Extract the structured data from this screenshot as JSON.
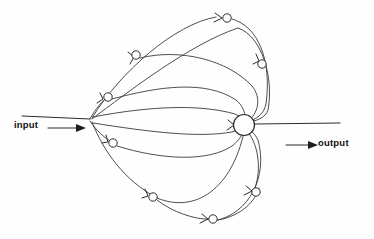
{
  "figure": {
    "type": "signal-flow-diagram",
    "title": "",
    "background_color": "#fefefe",
    "stroke_color": "#2b2b2b",
    "width": 374,
    "height": 239
  },
  "labels": {
    "input": "input",
    "output": "output"
  },
  "hub": {
    "name": "central-hub",
    "cx": 244,
    "cy": 125,
    "r": 10.5
  },
  "fanout_junction": {
    "name": "input-fanout-junction",
    "x": 90,
    "y": 120
  },
  "input_line": {
    "from_x": 22,
    "to_x": 90,
    "y": 116,
    "arrow_tip_x": 83,
    "arrow_y": 128
  },
  "output_line": {
    "from_x": 255,
    "to_x": 340,
    "y": 124,
    "arrow_tip_x": 315,
    "arrow_y": 145
  },
  "nodes": [
    {
      "name": "node-top",
      "cx": 227,
      "cy": 18,
      "r": 4.2
    },
    {
      "name": "node-upper-left",
      "cx": 136,
      "cy": 55,
      "r": 4.2
    },
    {
      "name": "node-left-upper",
      "cx": 108,
      "cy": 97,
      "r": 4.2
    },
    {
      "name": "node-left-lower",
      "cx": 113,
      "cy": 143,
      "r": 4.2
    },
    {
      "name": "node-lower-left",
      "cx": 153,
      "cy": 197,
      "r": 4.2
    },
    {
      "name": "node-bottom",
      "cx": 213,
      "cy": 219,
      "r": 4.2
    },
    {
      "name": "node-lower-right",
      "cx": 256,
      "cy": 192,
      "r": 4.2
    },
    {
      "name": "node-upper-right",
      "cx": 262,
      "cy": 64,
      "r": 4.2
    }
  ],
  "arcs": [
    {
      "name": "arc-outer-top",
      "d": "M 92 118 C 120 72 175 24 216 17"
    },
    {
      "name": "arc-top-return",
      "d": "M 232 19 C 258 26 272 60 266 104 C 264 114 256 120 248 121"
    },
    {
      "name": "arc-upper-1",
      "d": "M 92 119 C 128 92 190 44 238 28 C 262 36 274 78 268 110 C 266 118 254 122 247 122"
    },
    {
      "name": "arc-upper-2",
      "d": "M 140 58 C 180 48 228 60 252 86 C 262 98 258 114 248 121"
    },
    {
      "name": "arc-upper-3",
      "d": "M 112 99 C 160 86 206 80 236 100 C 244 106 246 116 245 121"
    },
    {
      "name": "arc-upper-inner",
      "d": "M 93 117 C 150 106 200 104 235 114 C 240 116 243 119 244 121"
    },
    {
      "name": "arc-lower-inner",
      "d": "M 93 123 C 150 132 198 138 232 132 C 238 130 242 127 244 127"
    },
    {
      "name": "arc-lower-1",
      "d": "M 117 146 C 162 160 208 162 232 146 C 240 140 244 132 244 128"
    },
    {
      "name": "arc-lower-2",
      "d": "M 92 122 C 104 152 124 180 157 198 C 196 214 232 188 244 132"
    },
    {
      "name": "arc-lower-3",
      "d": "M 157 200 C 172 212 196 220 209 219"
    },
    {
      "name": "arc-bottom",
      "d": "M 218 220 C 242 216 256 200 259 188"
    },
    {
      "name": "arc-bottom-right",
      "d": "M 255 188 C 262 168 258 142 246 130"
    },
    {
      "name": "arc-outer-bottom",
      "d": "M 214 221 C 250 214 268 176 258 140 C 254 132 248 128 245 127"
    }
  ],
  "chevrons": [
    {
      "name": "chevron-top",
      "d": "M 215 13 L 222 18 L 214 22"
    },
    {
      "name": "chevron-upper-left",
      "d": "M 130 64 L 134 57 L 128 52"
    },
    {
      "name": "chevron-left-upper",
      "d": "M 100 93 L 103 99 L 97 103"
    },
    {
      "name": "chevron-left-lower",
      "d": "M 106 135 L 108 142 L 102 143"
    },
    {
      "name": "chevron-lower-left",
      "d": "M 145 189 L 148 196 L 142 198"
    },
    {
      "name": "chevron-bottom",
      "d": "M 202 214 L 208 219 L 200 223"
    },
    {
      "name": "chevron-lower-right",
      "d": "M 246 186 L 252 191 L 244 195"
    },
    {
      "name": "chevron-upper-right",
      "d": "M 256 54 L 259 61 L 253 64"
    },
    {
      "name": "chevron-hub-left",
      "d": "M 228 120 L 234 125 L 227 130"
    }
  ]
}
